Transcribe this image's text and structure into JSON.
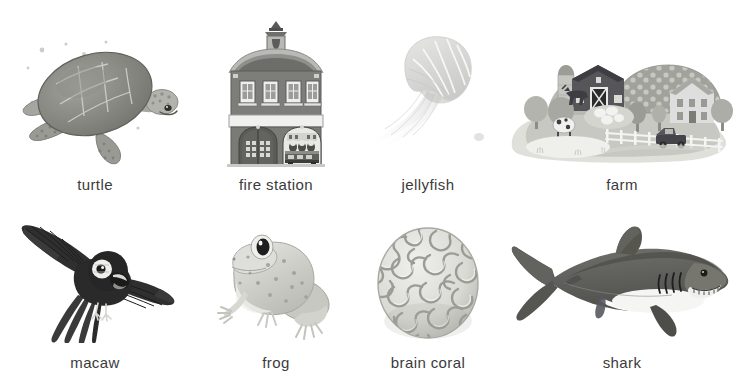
{
  "page": {
    "background_color": "#ffffff",
    "label_color": "#3b3b3b",
    "columns": 4,
    "rows": 2,
    "item_count": 8
  },
  "items": [
    {
      "id": "turtle",
      "label": "turtle",
      "icon": "sea-turtle-illustration",
      "row": 1,
      "column": 1
    },
    {
      "id": "fire_station",
      "label": "fire station",
      "icon": "fire-station-illustration",
      "row": 1,
      "column": 2
    },
    {
      "id": "jellyfish",
      "label": "jellyfish",
      "icon": "jellyfish-illustration",
      "row": 1,
      "column": 3
    },
    {
      "id": "farm",
      "label": "farm",
      "icon": "farm-scene-illustration",
      "row": 1,
      "column": 4
    },
    {
      "id": "macaw",
      "label": "macaw",
      "icon": "macaw-illustration",
      "row": 2,
      "column": 1
    },
    {
      "id": "frog",
      "label": "frog",
      "icon": "frog-illustration",
      "row": 2,
      "column": 2
    },
    {
      "id": "brain_coral",
      "label": "brain coral",
      "icon": "brain-coral-illustration",
      "row": 2,
      "column": 3
    },
    {
      "id": "shark",
      "label": "shark",
      "icon": "shark-illustration",
      "row": 2,
      "column": 4
    }
  ]
}
